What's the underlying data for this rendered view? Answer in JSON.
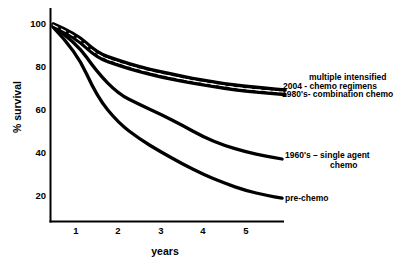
{
  "figure": {
    "background": "#ffffff",
    "ink": "#000000"
  },
  "chart_data": {
    "type": "line",
    "title": "",
    "xlabel": "years",
    "ylabel": "% survival",
    "xticks": [
      1,
      2,
      3,
      4,
      5
    ],
    "xtick_labels": [
      "1",
      "2",
      "3",
      "4",
      "5"
    ],
    "yticks": [
      100,
      80,
      60,
      40,
      20
    ],
    "ytick_labels": [
      "100",
      "80",
      "60",
      "40",
      "20"
    ],
    "xlim": [
      0.45,
      6.1
    ],
    "ylim": [
      10,
      104
    ],
    "grid": false,
    "legend_position": "labels-at-line-ends-right",
    "series": [
      {
        "name": "multiple intensified 2004 - chemo regimens",
        "label_lines": [
          "multiple intensified",
          "2004 - chemo regimens"
        ],
        "x": [
          0.46,
          1,
          1.5,
          2,
          2.5,
          3,
          3.5,
          4,
          4.5,
          5,
          5.5,
          5.93
        ],
        "y": [
          100,
          95.5,
          86.5,
          83,
          80,
          77.8,
          75.6,
          73.8,
          72.2,
          71,
          70,
          69.3
        ],
        "line_style": "solid-thick"
      },
      {
        "name": "1980's- combination chemo",
        "label_lines": [
          "1980's- combination chemo"
        ],
        "x": [
          0.46,
          1,
          1.5,
          2,
          2.5,
          3,
          3.5,
          4,
          4.5,
          5,
          5.5,
          5.93
        ],
        "y": [
          99.2,
          93.5,
          84.3,
          80.8,
          77.9,
          75.4,
          73.4,
          71.7,
          70.1,
          68.8,
          67.9,
          67.2
        ],
        "line_style": "solid-thick"
      },
      {
        "name": "1960's – single agent chemo",
        "label_lines": [
          "1960's – single agent",
          "chemo"
        ],
        "x": [
          0.46,
          1,
          1.5,
          2,
          2.5,
          3,
          3.5,
          4,
          4.5,
          5,
          5.5,
          5.86
        ],
        "y": [
          99,
          91.5,
          77.5,
          67.5,
          62.5,
          58,
          53,
          47.5,
          43.5,
          40.5,
          38.5,
          37.2
        ],
        "line_style": "solid-thick"
      },
      {
        "name": "pre-chemo",
        "label_lines": [
          "pre-chemo"
        ],
        "x": [
          0.46,
          1,
          1.5,
          2,
          2.5,
          3,
          3.5,
          4,
          4.5,
          5,
          5.5,
          5.86
        ],
        "y": [
          98.5,
          87.5,
          66,
          54,
          46.5,
          40.5,
          35,
          30,
          26,
          22.5,
          20.3,
          19
        ],
        "line_style": "solid-thick"
      }
    ],
    "band_separator": {
      "between_series": [
        0,
        1
      ],
      "style": "white-dashed"
    }
  }
}
